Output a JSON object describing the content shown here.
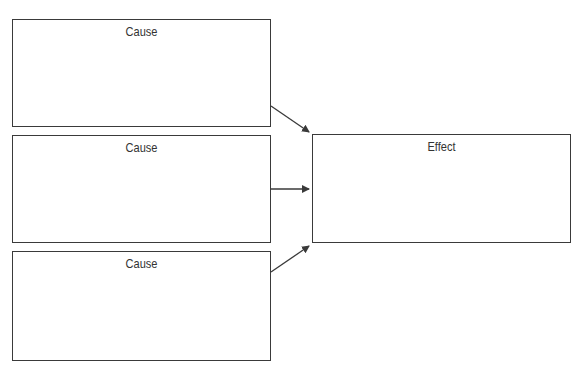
{
  "diagram": {
    "type": "cause-effect",
    "causes": [
      {
        "label": "Cause"
      },
      {
        "label": "Cause"
      },
      {
        "label": "Cause"
      }
    ],
    "effect": {
      "label": "Effect"
    },
    "colors": {
      "line": "#3a3a3a",
      "text": "#333333"
    }
  }
}
